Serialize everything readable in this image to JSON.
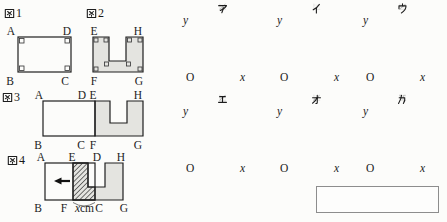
{
  "figures": {
    "fig1": {
      "title": "図1",
      "labels": {
        "tl": "A",
        "tr": "D",
        "bl": "B",
        "br": "C"
      }
    },
    "fig2": {
      "title": "図2",
      "labels": {
        "tl": "E",
        "tr": "H",
        "bl": "F",
        "br": "G"
      }
    },
    "fig3": {
      "title": "図3",
      "top": [
        "A",
        "D",
        "E",
        "H"
      ],
      "bottom": [
        "B",
        "C",
        "F",
        "G"
      ]
    },
    "fig4": {
      "title": "図4",
      "top": [
        "A",
        "E",
        "D",
        "H"
      ],
      "bottom": [
        "B",
        "F",
        "C",
        "G"
      ],
      "measure_value": "x",
      "measure_unit": "cm"
    }
  },
  "axis": {
    "x_label": "x",
    "y_label": "y",
    "origin_label": "O"
  },
  "graphs": [
    {
      "title": "ア",
      "points": [
        [
          0,
          0
        ],
        [
          1,
          1
        ]
      ],
      "vdash": [
        {
          "x": 0.32,
          "y": 0.32
        },
        {
          "x": 0.64,
          "y": 0.64
        },
        {
          "x": 1,
          "y": 1
        }
      ],
      "hdash": [
        {
          "y": 0.64,
          "x1": 0.64
        },
        {
          "y": 1,
          "x1": 1
        }
      ]
    },
    {
      "title": "イ",
      "points": [
        [
          0,
          0
        ],
        [
          0.3,
          0.18
        ],
        [
          0.7,
          0.76
        ],
        [
          1,
          1
        ]
      ],
      "vdash": [
        {
          "x": 0.3,
          "y": 0.18
        },
        {
          "x": 0.7,
          "y": 0.76
        },
        {
          "x": 1,
          "y": 1
        }
      ],
      "hdash": [
        {
          "y": 0.18,
          "x1": 0.3
        },
        {
          "y": 0.76,
          "x1": 0.7
        },
        {
          "y": 1,
          "x1": 1
        }
      ]
    },
    {
      "title": "ウ",
      "points": [
        [
          0,
          0
        ],
        [
          0.36,
          0.44
        ],
        [
          0.72,
          0.56
        ],
        [
          1,
          1
        ]
      ],
      "vdash": [
        {
          "x": 0.36,
          "y": 0.44
        },
        {
          "x": 0.72,
          "y": 0.56
        },
        {
          "x": 1,
          "y": 1
        }
      ],
      "hdash": [
        {
          "y": 0.44,
          "x1": 0.36
        },
        {
          "y": 0.56,
          "x1": 0.72
        },
        {
          "y": 1,
          "x1": 1
        }
      ]
    },
    {
      "title": "エ",
      "points": [
        [
          0,
          0
        ],
        [
          0.35,
          0.48
        ],
        [
          0.68,
          0.48
        ],
        [
          1,
          1
        ]
      ],
      "vdash": [
        {
          "x": 0.35,
          "y": 0.48
        },
        {
          "x": 0.68,
          "y": 0.48
        },
        {
          "x": 1,
          "y": 1
        }
      ],
      "hdash": [
        {
          "y": 0.48,
          "x1": 0.68
        },
        {
          "y": 1,
          "x1": 1
        }
      ]
    },
    {
      "title": "オ",
      "points": [
        [
          0,
          0
        ],
        [
          0.33,
          0.53
        ],
        [
          0.66,
          0.35
        ],
        [
          1,
          1
        ]
      ],
      "vdash": [
        {
          "x": 0.33,
          "y": 0.53
        },
        {
          "x": 0.66,
          "y": 0.35
        },
        {
          "x": 1,
          "y": 1
        }
      ],
      "hdash": [
        {
          "y": 0.53,
          "x1": 0.33
        },
        {
          "y": 0.35,
          "x1": 0.66
        },
        {
          "y": 1,
          "x1": 1
        }
      ]
    },
    {
      "title": "カ",
      "points": [
        [
          0,
          1
        ],
        [
          0.38,
          1
        ],
        [
          0.38,
          0.28
        ],
        [
          0.7,
          0.28
        ],
        [
          0.7,
          1
        ],
        [
          1,
          1
        ]
      ],
      "vdash": [
        {
          "x": 0.38,
          "y": 0.28
        },
        {
          "x": 0.7,
          "y": 0.28
        },
        {
          "x": 1,
          "y": 1
        }
      ],
      "hdash": [
        {
          "y": 0.28,
          "x1": 0.7
        },
        {
          "y": 1,
          "x0": 0.38,
          "x1": 0.7
        }
      ]
    }
  ],
  "answer_box": {
    "value": ""
  },
  "colors": {
    "shape_fill": "#e4e4e0",
    "line": "#1e1e1e",
    "dash": "#585858",
    "box_border": "#8d8d8d",
    "background": "#fcfcfa"
  }
}
